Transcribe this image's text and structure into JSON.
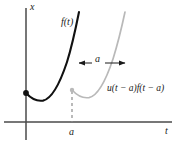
{
  "figure": {
    "axes": {
      "vertical_label": "x",
      "horizontal_label": "t",
      "origin": {
        "x": 26,
        "y": 122
      },
      "vertical_axis": {
        "x": 26,
        "y_top": 8,
        "y_bottom": 140
      },
      "horizontal_axis": {
        "y": 122,
        "x_left": 4,
        "x_right": 172
      },
      "axis_color": "#4a4a4a"
    },
    "curves": [
      {
        "name": "original-function",
        "label": "f(t)",
        "color": "#111111",
        "stroke_width": 2.1,
        "start_point": {
          "x": 26,
          "y": 93
        },
        "minimum_point": {
          "x": 42,
          "y": 101
        },
        "end_point": {
          "x": 79,
          "y": 12
        },
        "path": "M 26 93 C 32 99.5 37 101.5 43 100.6 C 51 99 59 86 67 62 C 72 46 76 27 79 12"
      },
      {
        "name": "shifted-function",
        "label": "u(t - a)f(t - a)",
        "color": "#b9b9b9",
        "stroke_width": 1.7,
        "start_point": {
          "x": 72,
          "y": 90
        },
        "minimum_point": {
          "x": 88,
          "y": 98
        },
        "end_point": {
          "x": 125,
          "y": 12
        },
        "path": "M 72 90 C 78 96.5 83 98.5 89 97.6 C 97 96 105 83 113 59 C 118 43 122 26 125 12"
      }
    ],
    "markers": [
      {
        "name": "origin-dot",
        "x": 26,
        "y": 93,
        "r": 2.9,
        "color": "#111111"
      },
      {
        "name": "shift-start-dot",
        "x": 72,
        "y": 90,
        "r": 2.2,
        "color": "#b9b9b9"
      }
    ],
    "dashed_line": {
      "name": "shift-guide-line",
      "x": 72,
      "y_top": 91,
      "y_bottom": 122,
      "color": "#8c8c8c",
      "dash": "3,3"
    },
    "shift_arrow": {
      "name": "shift-amount-arrow",
      "label": "a",
      "y": 63,
      "x_start": 78,
      "x_end": 126,
      "color": "#1a1a1a"
    },
    "tick_label": "a",
    "labels": {
      "vertical_axis": "x",
      "horizontal_axis": "t",
      "original_curve": "f(t)",
      "shift_amount": "a",
      "axis_tick": "a",
      "shifted_curve": "u(t − a)f(t − a)"
    }
  }
}
